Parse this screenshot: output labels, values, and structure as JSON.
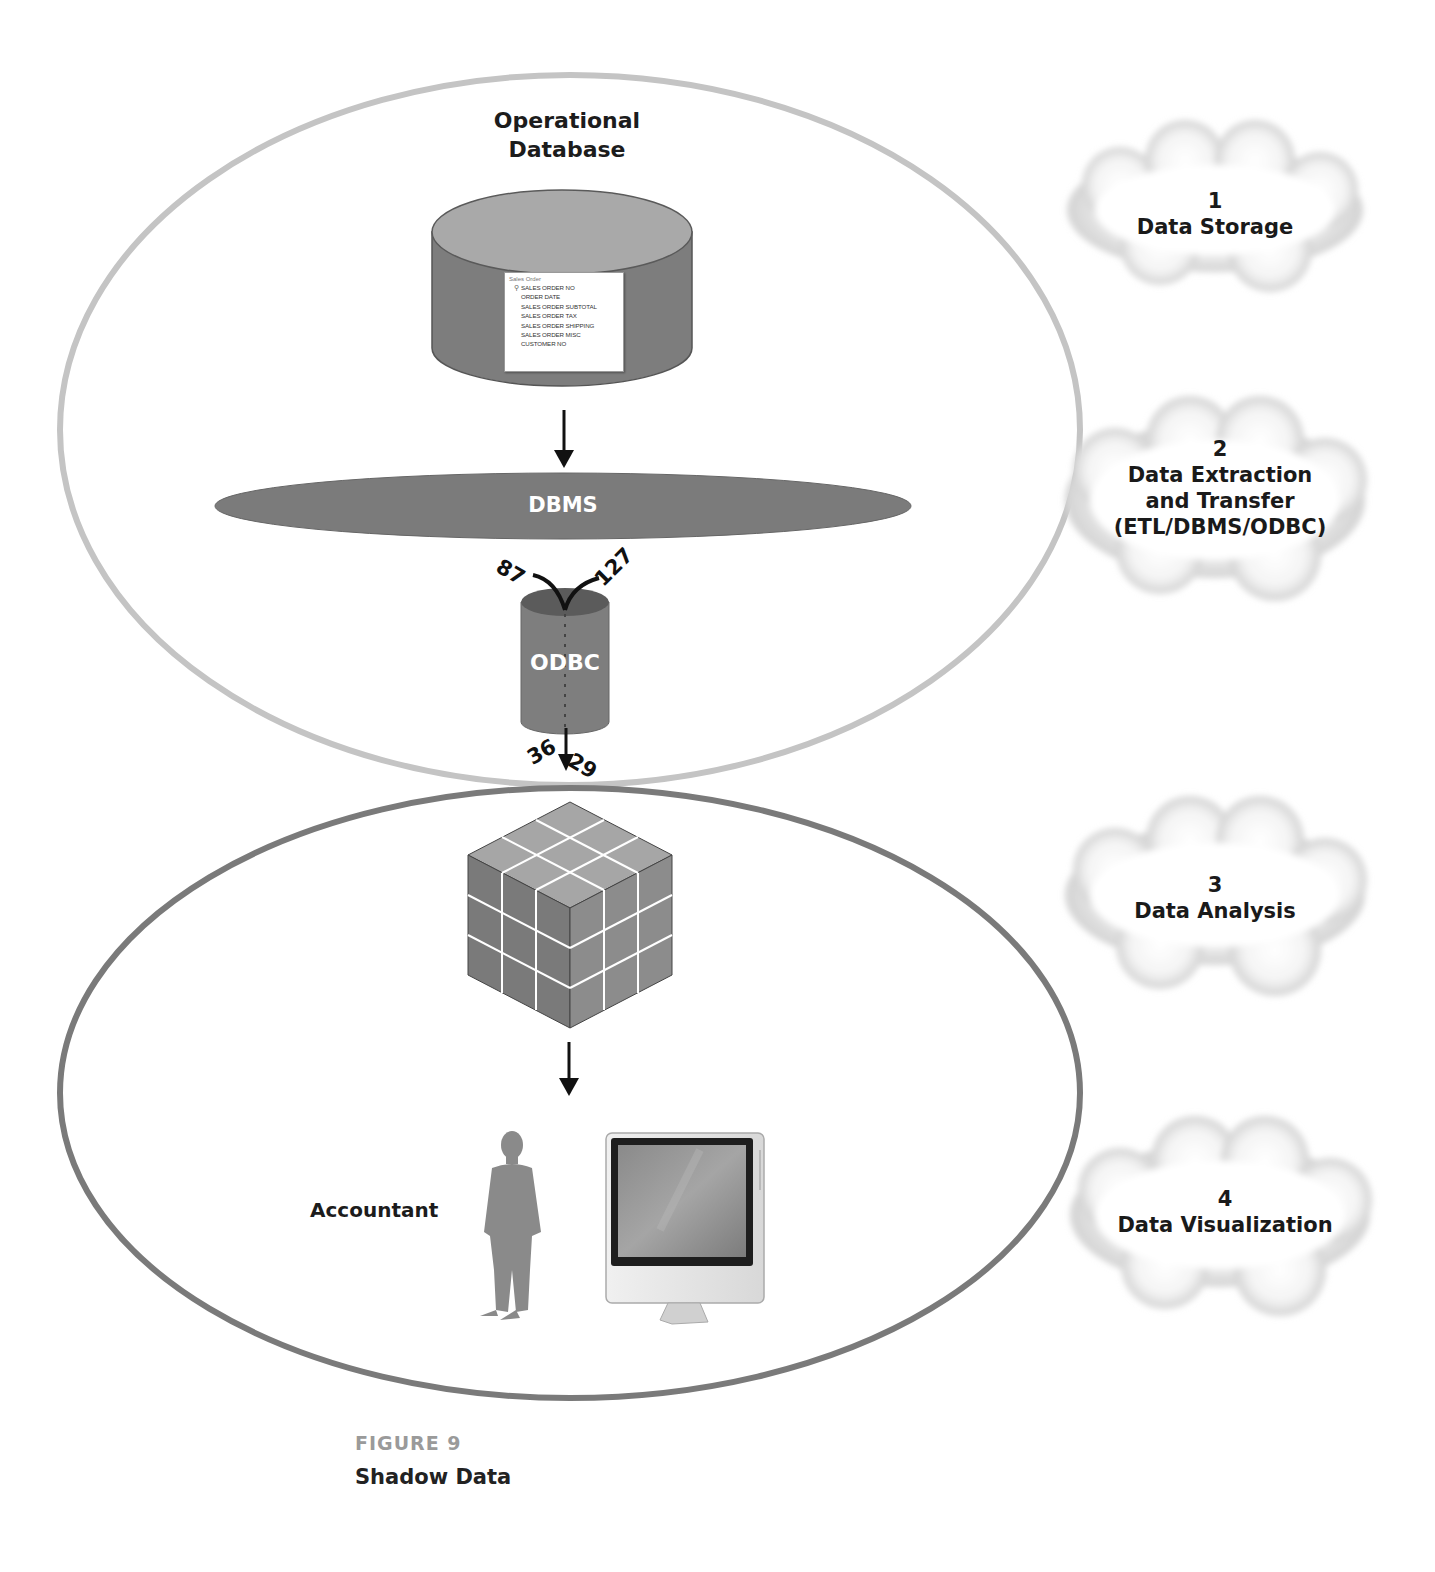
{
  "figure": {
    "label": "FIGURE 9",
    "caption": "Shadow Data"
  },
  "top_ellipse": {
    "stroke_color": "#c4c4c4",
    "database": {
      "title_line1": "Operational",
      "title_line2": "Database",
      "table": {
        "name": "Sales Order",
        "key_icon": "key-icon",
        "fields": [
          "SALES ORDER NO",
          "ORDER DATE",
          "SALES ORDER SUBTOTAL",
          "SALES ORDER TAX",
          "SALES ORDER SHIPPING",
          "SALES ORDER MISC",
          "CUSTOMER NO"
        ]
      }
    },
    "dbms_label": "DBMS",
    "odbc_label": "ODBC",
    "numbers": {
      "in_left": "87",
      "in_right": "127",
      "out_left": "36",
      "out_right": "29"
    }
  },
  "bottom_ellipse": {
    "stroke_color": "#7a7a7a",
    "cube_icon": "olap-cube-icon",
    "person_label": "Accountant",
    "person_icon": "businessman-icon",
    "computer_icon": "monitor-icon"
  },
  "clouds": [
    {
      "number": "1",
      "lines": [
        "Data Storage"
      ]
    },
    {
      "number": "2",
      "lines": [
        "Data Extraction",
        "and Transfer",
        "(ETL/DBMS/ODBC)"
      ]
    },
    {
      "number": "3",
      "lines": [
        "Data Analysis"
      ]
    },
    {
      "number": "4",
      "lines": [
        "Data Visualization"
      ]
    }
  ],
  "colors": {
    "cylinder_side": "#7d7d7d",
    "cylinder_top": "#a9a9a9",
    "dbms_fill": "#7b7b7b",
    "cube_top": "#a6a6a6",
    "cube_left": "#7a7a7a",
    "cube_right": "#8c8c8c"
  }
}
